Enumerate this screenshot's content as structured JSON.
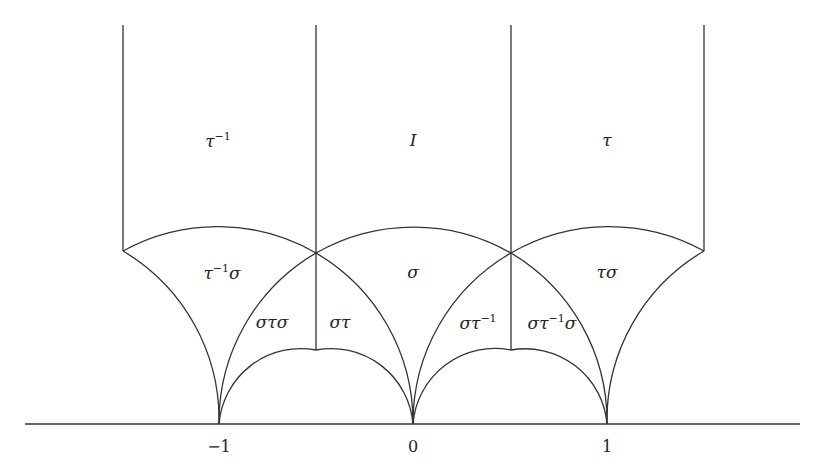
{
  "diagram": {
    "axis_ticks": [
      {
        "label": "−1",
        "x": 219
      },
      {
        "label": "0",
        "x": 413
      },
      {
        "label": "1",
        "x": 607
      }
    ],
    "regions": [
      {
        "id": "tau-inv",
        "base": "τ",
        "sup": "−1",
        "tail": "",
        "x": 218,
        "y": 140
      },
      {
        "id": "identity",
        "base": "I",
        "sup": "",
        "tail": "",
        "x": 413,
        "y": 140
      },
      {
        "id": "tau",
        "base": "τ",
        "sup": "",
        "tail": "",
        "x": 607,
        "y": 140
      },
      {
        "id": "tau-inv-sigma",
        "base": "τ",
        "sup": "−1",
        "tail": "σ",
        "x": 222,
        "y": 272
      },
      {
        "id": "sigma",
        "base": "σ",
        "sup": "",
        "tail": "",
        "x": 413,
        "y": 272
      },
      {
        "id": "tau-sigma",
        "base": "τσ",
        "sup": "",
        "tail": "",
        "x": 607,
        "y": 272
      },
      {
        "id": "sigma-tau-sigma",
        "base": "στσ",
        "sup": "",
        "tail": "",
        "x": 272,
        "y": 322
      },
      {
        "id": "sigma-tau",
        "base": "στ",
        "sup": "",
        "tail": "",
        "x": 340,
        "y": 322
      },
      {
        "id": "sigma-tau-inv",
        "base": "στ",
        "sup": "−1",
        "tail": "",
        "x": 478,
        "y": 322
      },
      {
        "id": "sigma-tau-inv-sigma",
        "base": "στ",
        "sup": "−1",
        "tail": "σ",
        "x": 552,
        "y": 322
      }
    ],
    "stroke_color": "#333333"
  }
}
